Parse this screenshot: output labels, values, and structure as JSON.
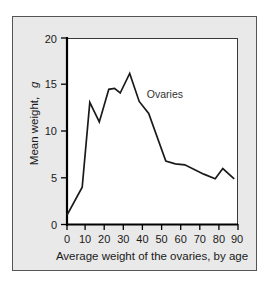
{
  "figure": {
    "background_color": "#e9e9e9",
    "frame_color": "#555555",
    "plot_background_color": "#ffffff",
    "axis_color": "#000000",
    "line_color": "#1a1a1a"
  },
  "chart_data": {
    "type": "line",
    "title": "",
    "subtitle": "",
    "xlabel": "Average weight of the ovaries, by age",
    "ylabel": "Mean weight, g",
    "ylabel_text": "Mean weight,",
    "ylabel_unit": "g",
    "xlim": [
      0,
      90
    ],
    "ylim": [
      0,
      20
    ],
    "xticks": [
      0,
      10,
      20,
      30,
      40,
      50,
      60,
      70,
      80,
      90
    ],
    "xtick_labels": [
      "0",
      "10",
      "20",
      "30",
      "40",
      "50",
      "60",
      "70",
      "80",
      "90"
    ],
    "yticks": [
      0,
      5,
      10,
      15,
      20
    ],
    "ytick_labels": [
      "0",
      "5",
      "10",
      "15",
      "20"
    ],
    "grid": false,
    "legend_position": "inline-annotation",
    "annotations": [
      {
        "text": "Ovaries",
        "x": 42,
        "y": 13.6
      }
    ],
    "series": [
      {
        "name": "Ovaries",
        "x": [
          0,
          8,
          12,
          17,
          22,
          25,
          28,
          33,
          38,
          43,
          52,
          57,
          62,
          72,
          78,
          82,
          88
        ],
        "values": [
          1.0,
          4.0,
          13.1,
          11.0,
          14.5,
          14.6,
          14.1,
          16.2,
          13.2,
          11.9,
          6.8,
          6.5,
          6.4,
          5.4,
          4.9,
          6.0,
          4.9
        ]
      }
    ]
  }
}
